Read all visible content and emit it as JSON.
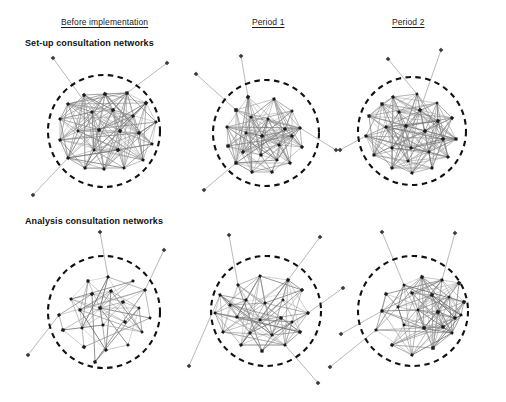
{
  "figure": {
    "type": "network-diagram-grid",
    "rows": 2,
    "columns": 3,
    "background_color": "#ffffff",
    "node_color": "#1c1c1c",
    "edge_color": "#8a8a8a",
    "boundary_color": "#111111",
    "boundary_style": "dashed-circle"
  },
  "columns": [
    {
      "label": "Before implementation",
      "center_x": 116
    },
    {
      "label": "Period 1",
      "center_x": 276
    },
    {
      "label": "Period 2",
      "center_x": 416
    }
  ],
  "rows": [
    {
      "label": "Set-up consultation networks"
    },
    {
      "label": "Analysis consultation networks"
    }
  ],
  "panels": [
    {
      "name": "setup-before-implementation",
      "row": 0,
      "column": 0,
      "circle": {
        "cx": 104,
        "cy": 131,
        "r": 56
      },
      "inner_nodes": 23,
      "outer_nodes": 3,
      "density": "very-high",
      "nodes": [
        [
          84,
          95
        ],
        [
          105,
          94
        ],
        [
          127,
          93
        ],
        [
          146,
          103
        ],
        [
          156,
          122
        ],
        [
          152,
          144
        ],
        [
          143,
          160
        ],
        [
          124,
          168
        ],
        [
          104,
          169
        ],
        [
          85,
          168
        ],
        [
          68,
          158
        ],
        [
          60,
          140
        ],
        [
          60,
          119
        ],
        [
          68,
          104
        ],
        [
          92,
          112
        ],
        [
          113,
          110
        ],
        [
          133,
          116
        ],
        [
          78,
          131
        ],
        [
          99,
          130
        ],
        [
          120,
          131
        ],
        [
          139,
          133
        ],
        [
          94,
          150
        ],
        [
          118,
          150
        ]
      ],
      "outliers": [
        {
          "pos": [
            53,
            58
          ],
          "link_to": 14
        },
        {
          "pos": [
            167,
            63
          ],
          "link_to": 2
        },
        {
          "pos": [
            33,
            195
          ],
          "link_to": 10
        }
      ]
    },
    {
      "name": "setup-period-1",
      "row": 0,
      "column": 1,
      "circle": {
        "cx": 266,
        "cy": 133,
        "r": 53
      },
      "inner_nodes": 22,
      "outer_nodes": 4,
      "density": "high",
      "nodes": [
        [
          248,
          97
        ],
        [
          274,
          99
        ],
        [
          292,
          111
        ],
        [
          300,
          128
        ],
        [
          302,
          147
        ],
        [
          290,
          163
        ],
        [
          272,
          172
        ],
        [
          252,
          172
        ],
        [
          236,
          163
        ],
        [
          228,
          146
        ],
        [
          227,
          127
        ],
        [
          236,
          110
        ],
        [
          251,
          117
        ],
        [
          268,
          119
        ],
        [
          285,
          129
        ],
        [
          246,
          133
        ],
        [
          262,
          136
        ],
        [
          279,
          145
        ],
        [
          243,
          152
        ],
        [
          261,
          155
        ],
        [
          277,
          160
        ],
        [
          292,
          136
        ]
      ],
      "outliers": [
        {
          "pos": [
            241,
            56
          ],
          "link_to": 0
        },
        {
          "pos": [
            196,
            74
          ],
          "link_to": 11
        },
        {
          "pos": [
            204,
            190
          ],
          "link_to": 8
        },
        {
          "pos": [
            336,
            150
          ],
          "link_to": 3
        }
      ]
    },
    {
      "name": "setup-period-2",
      "row": 0,
      "column": 2,
      "circle": {
        "cx": 412,
        "cy": 131,
        "r": 54
      },
      "inner_nodes": 24,
      "outer_nodes": 3,
      "density": "very-high",
      "nodes": [
        [
          393,
          97
        ],
        [
          417,
          94
        ],
        [
          437,
          103
        ],
        [
          452,
          118
        ],
        [
          456,
          139
        ],
        [
          448,
          157
        ],
        [
          432,
          168
        ],
        [
          412,
          173
        ],
        [
          392,
          168
        ],
        [
          374,
          155
        ],
        [
          366,
          136
        ],
        [
          369,
          116
        ],
        [
          382,
          104
        ],
        [
          399,
          112
        ],
        [
          420,
          110
        ],
        [
          438,
          121
        ],
        [
          386,
          127
        ],
        [
          406,
          126
        ],
        [
          425,
          131
        ],
        [
          443,
          139
        ],
        [
          392,
          148
        ],
        [
          411,
          148
        ],
        [
          429,
          152
        ],
        [
          408,
          161
        ]
      ],
      "outliers": [
        {
          "pos": [
            388,
            59
          ],
          "link_to": 1
        },
        {
          "pos": [
            441,
            50
          ],
          "link_to": 14
        },
        {
          "pos": [
            340,
            150
          ],
          "link_to": 10
        }
      ]
    },
    {
      "name": "analysis-before-implementation",
      "row": 1,
      "column": 0,
      "circle": {
        "cx": 104,
        "cy": 312,
        "r": 56
      },
      "inner_nodes": 22,
      "outer_nodes": 3,
      "density": "medium",
      "nodes": [
        [
          108,
          277
        ],
        [
          88,
          281
        ],
        [
          133,
          281
        ],
        [
          111,
          291
        ],
        [
          92,
          294
        ],
        [
          71,
          299
        ],
        [
          145,
          290
        ],
        [
          59,
          315
        ],
        [
          63,
          330
        ],
        [
          80,
          310
        ],
        [
          100,
          308
        ],
        [
          123,
          302
        ],
        [
          139,
          308
        ],
        [
          150,
          318
        ],
        [
          82,
          328
        ],
        [
          103,
          325
        ],
        [
          125,
          322
        ],
        [
          142,
          332
        ],
        [
          84,
          347
        ],
        [
          106,
          350
        ],
        [
          128,
          345
        ],
        [
          95,
          362
        ]
      ],
      "outliers": [
        {
          "pos": [
            100,
            232
          ],
          "link_to": 0
        },
        {
          "pos": [
            164,
            250
          ],
          "link_to": 6
        },
        {
          "pos": [
            28,
            355
          ],
          "link_to": 7
        }
      ]
    },
    {
      "name": "analysis-period-1",
      "row": 1,
      "column": 1,
      "circle": {
        "cx": 266,
        "cy": 311,
        "r": 55
      },
      "inner_nodes": 22,
      "outer_nodes": 5,
      "density": "medium-high",
      "nodes": [
        [
          260,
          276
        ],
        [
          288,
          280
        ],
        [
          302,
          290
        ],
        [
          238,
          285
        ],
        [
          220,
          295
        ],
        [
          215,
          313
        ],
        [
          223,
          332
        ],
        [
          241,
          345
        ],
        [
          262,
          351
        ],
        [
          285,
          345
        ],
        [
          300,
          332
        ],
        [
          308,
          313
        ],
        [
          246,
          300
        ],
        [
          265,
          303
        ],
        [
          283,
          300
        ],
        [
          237,
          317
        ],
        [
          260,
          320
        ],
        [
          281,
          318
        ],
        [
          250,
          333
        ],
        [
          272,
          335
        ],
        [
          292,
          322
        ],
        [
          230,
          305
        ]
      ],
      "outliers": [
        {
          "pos": [
            229,
            235
          ],
          "link_to": 3
        },
        {
          "pos": [
            320,
            237
          ],
          "link_to": 1
        },
        {
          "pos": [
            189,
            366
          ],
          "link_to": 4
        },
        {
          "pos": [
            318,
            383
          ],
          "link_to": 9
        },
        {
          "pos": [
            343,
            288
          ],
          "link_to": 11
        }
      ]
    },
    {
      "name": "analysis-period-2",
      "row": 1,
      "column": 2,
      "circle": {
        "cx": 413,
        "cy": 311,
        "r": 55
      },
      "inner_nodes": 23,
      "outer_nodes": 4,
      "density": "medium-high",
      "nodes": [
        [
          422,
          277
        ],
        [
          442,
          280
        ],
        [
          459,
          283
        ],
        [
          404,
          285
        ],
        [
          386,
          294
        ],
        [
          464,
          302
        ],
        [
          382,
          311
        ],
        [
          376,
          330
        ],
        [
          392,
          345
        ],
        [
          412,
          355
        ],
        [
          433,
          348
        ],
        [
          452,
          333
        ],
        [
          461,
          315
        ],
        [
          412,
          293
        ],
        [
          432,
          295
        ],
        [
          449,
          297
        ],
        [
          398,
          307
        ],
        [
          418,
          310
        ],
        [
          438,
          312
        ],
        [
          455,
          318
        ],
        [
          404,
          325
        ],
        [
          424,
          328
        ],
        [
          443,
          327
        ]
      ],
      "outliers": [
        {
          "pos": [
            382,
            232
          ],
          "link_to": 3
        },
        {
          "pos": [
            455,
            233
          ],
          "link_to": 1
        },
        {
          "pos": [
            341,
            334
          ],
          "link_to": 6
        },
        {
          "pos": [
            330,
            367
          ],
          "link_to": 7
        }
      ]
    }
  ]
}
